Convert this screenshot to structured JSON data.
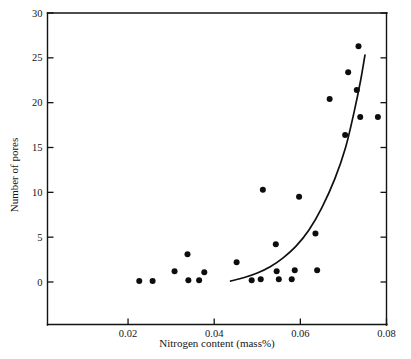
{
  "chart_data": {
    "type": "scatter",
    "title": "",
    "xlabel": "Nitrogen content (mass%)",
    "ylabel": "Number of pores",
    "xlim": [
      0.0013,
      0.08
    ],
    "ylim": [
      -4.8,
      30
    ],
    "xticks": [
      0.02,
      0.04,
      0.06,
      0.08
    ],
    "xtick_labels": [
      "0.02",
      "0.04",
      "0.06",
      "0.08"
    ],
    "yticks": [
      0,
      5,
      10,
      15,
      20,
      25,
      30
    ],
    "ytick_labels": [
      "0",
      "5",
      "10",
      "15",
      "20",
      "25",
      "30"
    ],
    "grid": false,
    "legend": null,
    "marker": "filled-circle",
    "points": [
      {
        "x": 0.0226,
        "y": 0.1
      },
      {
        "x": 0.0257,
        "y": 0.1
      },
      {
        "x": 0.0308,
        "y": 1.2
      },
      {
        "x": 0.0338,
        "y": 3.1
      },
      {
        "x": 0.034,
        "y": 0.2
      },
      {
        "x": 0.0365,
        "y": 0.2
      },
      {
        "x": 0.0377,
        "y": 1.1
      },
      {
        "x": 0.0452,
        "y": 2.2
      },
      {
        "x": 0.0487,
        "y": 0.2
      },
      {
        "x": 0.0508,
        "y": 0.3
      },
      {
        "x": 0.0513,
        "y": 10.3
      },
      {
        "x": 0.0543,
        "y": 4.2
      },
      {
        "x": 0.0545,
        "y": 1.2
      },
      {
        "x": 0.055,
        "y": 0.3
      },
      {
        "x": 0.058,
        "y": 0.3
      },
      {
        "x": 0.0587,
        "y": 1.3
      },
      {
        "x": 0.0597,
        "y": 9.5
      },
      {
        "x": 0.0635,
        "y": 5.4
      },
      {
        "x": 0.0639,
        "y": 1.3
      },
      {
        "x": 0.0668,
        "y": 20.4
      },
      {
        "x": 0.0704,
        "y": 16.4
      },
      {
        "x": 0.0711,
        "y": 23.4
      },
      {
        "x": 0.0731,
        "y": 21.4
      },
      {
        "x": 0.0735,
        "y": 26.3
      },
      {
        "x": 0.0739,
        "y": 18.4
      },
      {
        "x": 0.078,
        "y": 18.4
      }
    ],
    "fit_curve": {
      "name": "trend-line",
      "points": [
        {
          "x": 0.0438,
          "y": 0.1
        },
        {
          "x": 0.047,
          "y": 0.5
        },
        {
          "x": 0.05,
          "y": 1.0
        },
        {
          "x": 0.053,
          "y": 1.7
        },
        {
          "x": 0.056,
          "y": 2.7
        },
        {
          "x": 0.059,
          "y": 4.0
        },
        {
          "x": 0.062,
          "y": 5.8
        },
        {
          "x": 0.065,
          "y": 8.3
        },
        {
          "x": 0.068,
          "y": 11.5
        },
        {
          "x": 0.0705,
          "y": 15.0
        },
        {
          "x": 0.0725,
          "y": 19.0
        },
        {
          "x": 0.074,
          "y": 22.5
        },
        {
          "x": 0.075,
          "y": 25.3
        }
      ]
    }
  }
}
